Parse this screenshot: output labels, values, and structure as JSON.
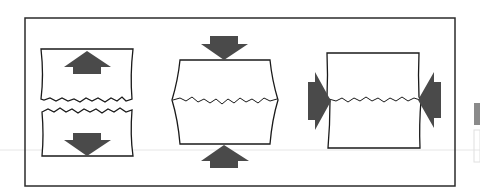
{
  "diagram": {
    "title": "",
    "panels": [
      {
        "id": "tension",
        "label": "",
        "load": "pull-apart",
        "arrows": [
          "up",
          "down"
        ],
        "crack": "separated"
      },
      {
        "id": "compression",
        "label": "",
        "load": "push-together",
        "arrows": [
          "down",
          "up"
        ],
        "crack": "bulged"
      },
      {
        "id": "shear",
        "label": "",
        "load": "side-compression",
        "arrows": [
          "right",
          "left"
        ],
        "crack": "horizontal"
      }
    ]
  },
  "colors": {
    "frame": "#2b2b2b",
    "arrow": "#4a4a4a",
    "outline": "#1a1a1a",
    "background": "#ffffff",
    "artifact": "#d8d8d8"
  }
}
